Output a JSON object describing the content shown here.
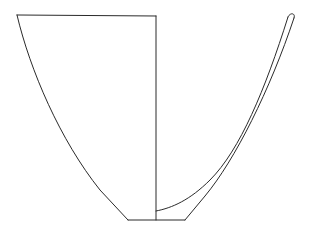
{
  "figure": {
    "type": "pottery-profile-drawing",
    "line_color": "#2a2a2a",
    "background": "#ffffff",
    "parts": {
      "exterior_view": "left half outline",
      "section": "right half wall profile",
      "axis": "center vertical line",
      "base": "flat foot line"
    }
  }
}
